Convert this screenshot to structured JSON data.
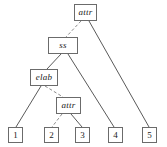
{
  "diagram": {
    "colors": {
      "box_border": "#6b6b6b",
      "box_fill": "#ffffff",
      "edge_solid": "#5a5a5a",
      "edge_dashed": "#8a8a8a",
      "text": "#1a1a1a",
      "background": "#ffffff"
    },
    "nodes": [
      {
        "id": "attr-top",
        "label": "attr",
        "kind": "internal",
        "x": 74,
        "y": 4,
        "w": 23,
        "h": 17
      },
      {
        "id": "ss",
        "label": "ss",
        "kind": "internal",
        "x": 48,
        "y": 37,
        "w": 30,
        "h": 17
      },
      {
        "id": "elab",
        "label": "elab",
        "kind": "internal",
        "x": 30,
        "y": 69,
        "w": 28,
        "h": 17
      },
      {
        "id": "attr-lower",
        "label": "attr",
        "kind": "internal",
        "x": 56,
        "y": 97,
        "w": 25,
        "h": 17
      },
      {
        "id": "leaf-1",
        "label": "1",
        "kind": "leaf",
        "x": 8,
        "y": 127,
        "w": 15,
        "h": 16
      },
      {
        "id": "leaf-2",
        "label": "2",
        "kind": "leaf",
        "x": 44,
        "y": 127,
        "w": 15,
        "h": 16
      },
      {
        "id": "leaf-3",
        "label": "3",
        "kind": "leaf",
        "x": 75,
        "y": 127,
        "w": 15,
        "h": 16
      },
      {
        "id": "leaf-4",
        "label": "4",
        "kind": "leaf",
        "x": 108,
        "y": 127,
        "w": 15,
        "h": 16
      },
      {
        "id": "leaf-5",
        "label": "5",
        "kind": "leaf",
        "x": 142,
        "y": 127,
        "w": 15,
        "h": 16
      }
    ],
    "edges": [
      {
        "id": "attr-top-to-ss",
        "from": "attr-top",
        "to": "ss",
        "style": "dashed",
        "x1": 81,
        "y1": 21,
        "x2": 66,
        "y2": 37
      },
      {
        "id": "attr-top-to-leaf-5",
        "from": "attr-top",
        "to": "leaf-5",
        "style": "solid",
        "x1": 89,
        "y1": 21,
        "x2": 149,
        "y2": 127
      },
      {
        "id": "ss-to-elab",
        "from": "ss",
        "to": "elab",
        "style": "solid",
        "x1": 61,
        "y1": 54,
        "x2": 47,
        "y2": 69
      },
      {
        "id": "ss-to-leaf-4",
        "from": "ss",
        "to": "leaf-4",
        "style": "solid",
        "x1": 68,
        "y1": 54,
        "x2": 114,
        "y2": 127
      },
      {
        "id": "elab-to-leaf-1",
        "from": "elab",
        "to": "leaf-1",
        "style": "solid",
        "x1": 41,
        "y1": 86,
        "x2": 16,
        "y2": 127
      },
      {
        "id": "elab-to-attr-lower",
        "from": "elab",
        "to": "attr-lower",
        "style": "dashed",
        "x1": 45,
        "y1": 86,
        "x2": 63,
        "y2": 97
      },
      {
        "id": "attr-lower-to-leaf-2",
        "from": "attr-lower",
        "to": "leaf-2",
        "style": "dashed",
        "x1": 62,
        "y1": 114,
        "x2": 52,
        "y2": 127
      },
      {
        "id": "attr-lower-to-leaf-3",
        "from": "attr-lower",
        "to": "leaf-3",
        "style": "solid",
        "x1": 71,
        "y1": 114,
        "x2": 82,
        "y2": 127
      }
    ]
  }
}
